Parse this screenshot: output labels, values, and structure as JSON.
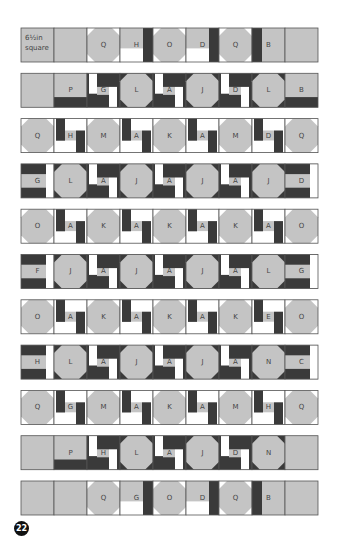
{
  "diagram": {
    "page_number": "22",
    "corner_label": [
      "6½in",
      "square"
    ],
    "colors": {
      "grey": "#c4c4c4",
      "dark": "#3a3a3a",
      "white": "#ffffff",
      "outline": "#555555",
      "text": "#444444"
    },
    "rows": [
      {
        "cells": [
          {
            "type": "plain",
            "label": ""
          },
          {
            "type": "plain",
            "label": ""
          },
          {
            "type": "octR",
            "label": "Q",
            "corners": "bottom-right-white"
          },
          {
            "type": "hbar",
            "label": "H"
          },
          {
            "type": "octbar",
            "label": "O"
          },
          {
            "type": "dbar",
            "label": "D"
          },
          {
            "type": "octL",
            "label": "Q"
          },
          {
            "type": "bbar",
            "label": "B"
          },
          {
            "type": "plain",
            "label": ""
          }
        ]
      },
      {
        "cells": [
          {
            "type": "plain",
            "label": ""
          },
          {
            "type": "plainDarkCorner",
            "label": "P"
          },
          {
            "type": "gstrip",
            "label": "G"
          },
          {
            "type": "oct",
            "label": "L"
          },
          {
            "type": "astrip",
            "label": "A"
          },
          {
            "type": "oct",
            "label": "J"
          },
          {
            "type": "dstrip",
            "label": "D"
          },
          {
            "type": "oct",
            "label": "L"
          },
          {
            "type": "bstrip",
            "label": "B"
          }
        ]
      },
      {
        "cells": [
          {
            "type": "octW",
            "label": "Q"
          },
          {
            "type": "hstrip",
            "label": "H"
          },
          {
            "type": "octW",
            "label": "M"
          },
          {
            "type": "awhite",
            "label": "A"
          },
          {
            "type": "octW",
            "label": "K"
          },
          {
            "type": "awhite",
            "label": "A"
          },
          {
            "type": "octW",
            "label": "M"
          },
          {
            "type": "dwhite",
            "label": "D"
          },
          {
            "type": "octW",
            "label": "Q"
          }
        ]
      },
      {
        "cells": [
          {
            "type": "gside",
            "label": "G"
          },
          {
            "type": "oct",
            "label": "L"
          },
          {
            "type": "astrip",
            "label": "A"
          },
          {
            "type": "oct",
            "label": "J"
          },
          {
            "type": "astrip",
            "label": "A"
          },
          {
            "type": "oct",
            "label": "J"
          },
          {
            "type": "astrip",
            "label": "A"
          },
          {
            "type": "oct",
            "label": "J"
          },
          {
            "type": "dside",
            "label": "D"
          }
        ]
      },
      {
        "cells": [
          {
            "type": "octW",
            "label": "O"
          },
          {
            "type": "awhite",
            "label": "A"
          },
          {
            "type": "octW",
            "label": "K"
          },
          {
            "type": "awhite",
            "label": "A"
          },
          {
            "type": "octW",
            "label": "K"
          },
          {
            "type": "awhite",
            "label": "A"
          },
          {
            "type": "octW",
            "label": "K"
          },
          {
            "type": "awhite",
            "label": "A"
          },
          {
            "type": "octW",
            "label": "O"
          }
        ]
      },
      {
        "cells": [
          {
            "type": "fside",
            "label": "F"
          },
          {
            "type": "oct",
            "label": "J"
          },
          {
            "type": "astrip",
            "label": "A"
          },
          {
            "type": "oct",
            "label": "J"
          },
          {
            "type": "astrip",
            "label": "A"
          },
          {
            "type": "oct",
            "label": "J"
          },
          {
            "type": "astrip",
            "label": "A"
          },
          {
            "type": "oct",
            "label": "L"
          },
          {
            "type": "gside2",
            "label": "G"
          }
        ]
      },
      {
        "cells": [
          {
            "type": "octW",
            "label": "O"
          },
          {
            "type": "awhite",
            "label": "A"
          },
          {
            "type": "octW",
            "label": "K"
          },
          {
            "type": "awhite",
            "label": "A"
          },
          {
            "type": "octW",
            "label": "K"
          },
          {
            "type": "awhite",
            "label": "A"
          },
          {
            "type": "octW",
            "label": "K"
          },
          {
            "type": "ewhite",
            "label": "E"
          },
          {
            "type": "octW",
            "label": "O"
          }
        ]
      },
      {
        "cells": [
          {
            "type": "hside",
            "label": "H"
          },
          {
            "type": "oct",
            "label": "L"
          },
          {
            "type": "astrip",
            "label": "A"
          },
          {
            "type": "oct",
            "label": "J"
          },
          {
            "type": "astrip",
            "label": "A"
          },
          {
            "type": "oct",
            "label": "J"
          },
          {
            "type": "astrip",
            "label": "A"
          },
          {
            "type": "oct",
            "label": "N"
          },
          {
            "type": "cside",
            "label": "C"
          }
        ]
      },
      {
        "cells": [
          {
            "type": "octW",
            "label": "Q"
          },
          {
            "type": "gwhite",
            "label": "G"
          },
          {
            "type": "octW",
            "label": "M"
          },
          {
            "type": "awhite",
            "label": "A"
          },
          {
            "type": "octW",
            "label": "K"
          },
          {
            "type": "awhite",
            "label": "A"
          },
          {
            "type": "octW",
            "label": "M"
          },
          {
            "type": "hwhite",
            "label": "H"
          },
          {
            "type": "octW",
            "label": "Q"
          }
        ]
      },
      {
        "cells": [
          {
            "type": "plain",
            "label": ""
          },
          {
            "type": "plainDarkCornerTop",
            "label": "P"
          },
          {
            "type": "hstripB",
            "label": "H"
          },
          {
            "type": "oct",
            "label": "L"
          },
          {
            "type": "astrip",
            "label": "A"
          },
          {
            "type": "oct",
            "label": "J"
          },
          {
            "type": "dstripB",
            "label": "D"
          },
          {
            "type": "oct",
            "label": "N"
          },
          {
            "type": "plain",
            "label": ""
          }
        ]
      },
      {
        "cells": [
          {
            "type": "plain",
            "label": ""
          },
          {
            "type": "plain",
            "label": ""
          },
          {
            "type": "octTopR",
            "label": "Q"
          },
          {
            "type": "gtop",
            "label": "G"
          },
          {
            "type": "octTopBar",
            "label": "O"
          },
          {
            "type": "dtop",
            "label": "D"
          },
          {
            "type": "octTopL",
            "label": "Q"
          },
          {
            "type": "bbar",
            "label": "B"
          },
          {
            "type": "plain",
            "label": ""
          }
        ]
      }
    ]
  }
}
